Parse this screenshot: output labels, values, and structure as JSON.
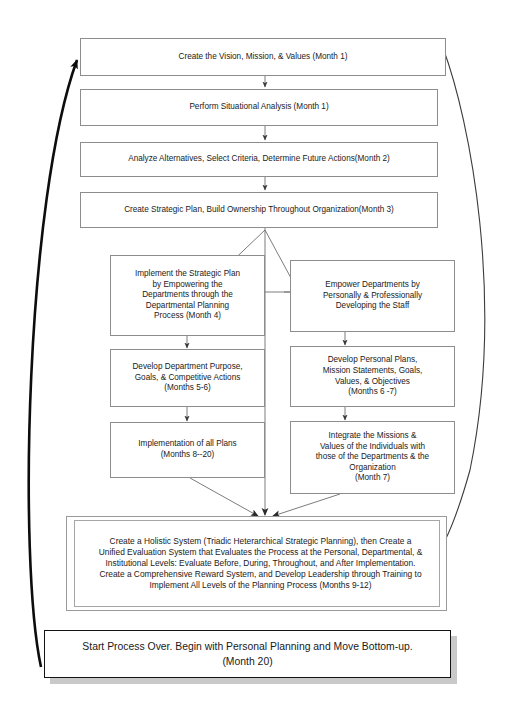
{
  "diagram": {
    "stroke_color": "#8d8d8d",
    "text_color": "#1a1a1a",
    "accent_color": "#131313",
    "shadow_color": "#c9c9c9",
    "background": "#ffffff"
  },
  "nodes": {
    "vision": "Create the Vision, Mission, & Values (Month 1)",
    "situational": "Perform Situational Analysis (Month 1)",
    "alternatives": "Analyze Alternatives, Select Criteria, Determine Future Actions(Month 2)",
    "strategic_plan": "Create Strategic Plan, Build Ownership Throughout Organization(Month 3)",
    "implement_plan": "Implement the Strategic Plan\nby Empowering the\nDepartments through the\nDepartmental Planning\nProcess (Month 4)",
    "empower_departments": "Empower Departments by\nPersonally & Professionally\nDeveloping the Staff",
    "develop_department": "Develop Department Purpose,\nGoals, & Competitive Actions\n(Months 5-6)",
    "develop_personal": "Develop Personal Plans,\nMission Statements, Goals,\nValues, & Objectives\n(Months 6 -7)",
    "implementation_all": "Implementation of  all  Plans\n(Months 8--20)",
    "integrate_missions": "Integrate the Missions &\nValues of the Individuals with\nthose of the Departments & the\nOrganization\n(Month 7)",
    "holistic_system": "Create a Holistic System (Triadic Heterarchical Strategic Planning), then Create a Unified Evaluation System that Evaluates the Process at the Personal, Departmental, & Institutional Levels: Evaluate Before, During, Throughout, and After Implementation. Create a Comprehensive Reward System, and Develop Leadership through Training to Implement All Levels of the Planning Process (Months 9-12)",
    "restart": "Start Process Over. Begin with Personal Planning and Move Bottom-up.\n(Month 20)"
  },
  "connectors": [
    {
      "name": "vision-to-situational",
      "kind": "arrow-down"
    },
    {
      "name": "situational-to-alternatives",
      "kind": "arrow-down"
    },
    {
      "name": "alternatives-to-strategic-plan",
      "kind": "arrow-down"
    },
    {
      "name": "strategic-plan-branch-left",
      "kind": "arrow-branch"
    },
    {
      "name": "strategic-plan-branch-right",
      "kind": "arrow-branch"
    },
    {
      "name": "implement-to-develop-department",
      "kind": "arrow-down"
    },
    {
      "name": "empower-to-develop-personal",
      "kind": "arrow-down"
    },
    {
      "name": "develop-department-to-implementation",
      "kind": "arrow-down"
    },
    {
      "name": "develop-personal-to-integrate",
      "kind": "arrow-down"
    },
    {
      "name": "implementation-to-holistic",
      "kind": "arrow-diagonal"
    },
    {
      "name": "integrate-to-holistic",
      "kind": "arrow-diagonal"
    },
    {
      "name": "strategic-plan-to-holistic",
      "kind": "arrow-vertical-long"
    },
    {
      "name": "restart-feedback-to-vision",
      "kind": "curve-thick-left"
    },
    {
      "name": "vision-feedback-to-holistic",
      "kind": "curve-thin-right"
    }
  ]
}
